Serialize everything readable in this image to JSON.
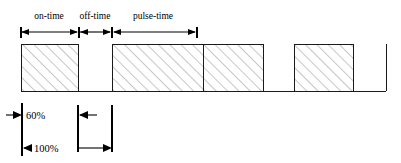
{
  "diagram": {
    "canvas": {
      "width": 401,
      "height": 163
    },
    "colors": {
      "line": "#1a1a1a",
      "hatch": "#8a8a8a",
      "background": "#ffffff",
      "text": "#000000"
    },
    "top_dimensions": [
      {
        "id": "on-time",
        "label": "on-time",
        "x_start": 21,
        "x_end": 78,
        "label_x": 49,
        "label_y": 19
      },
      {
        "id": "off-time",
        "label": "off-time",
        "x_start": 78,
        "x_end": 112,
        "label_x": 95,
        "label_y": 19
      },
      {
        "id": "pulse-time",
        "label": "pulse-time",
        "x_start": 112,
        "x_end": 196,
        "label_x": 153,
        "label_y": 19
      }
    ],
    "dimension_line_y": 32,
    "waveform": {
      "baseline_y": 91,
      "top_y": 44,
      "x_start": 21,
      "x_end": 386,
      "pulses": [
        {
          "index": 1,
          "x_start": 21,
          "x_end": 78
        },
        {
          "index": 2,
          "x_start": 112,
          "x_end": 203
        },
        {
          "index": 3,
          "x_start": 203,
          "x_end": 263
        },
        {
          "index": 4,
          "x_start": 294,
          "x_end": 353
        }
      ],
      "gaps": [
        {
          "x_start": 78,
          "x_end": 112
        },
        {
          "x_start": 263,
          "x_end": 294
        },
        {
          "x_start": 353,
          "x_end": 386
        }
      ]
    },
    "bottom_annotations": {
      "extension_lines": [
        {
          "id": "left-edge",
          "x": 22,
          "y_top": 103,
          "y_bottom": 156
        },
        {
          "id": "on-time-edge",
          "x": 78,
          "y_top": 105,
          "y_bottom": 152
        },
        {
          "id": "pulse-edge",
          "x": 112,
          "y_top": 105,
          "y_bottom": 152
        }
      ],
      "measures": [
        {
          "id": "duty-60",
          "label": "60%",
          "label_x": 26,
          "label_y": 118,
          "arrow_y": 115,
          "arrow_from_x": 22,
          "arrow_to_x": 8,
          "direction": "left"
        },
        {
          "id": "duty-100",
          "label": "100%",
          "label_x": 28,
          "label_y": 152,
          "arrow_y": 148,
          "arrow_from_x": 22,
          "arrow_to_x": 8,
          "direction": "left"
        },
        {
          "id": "off-span-upper",
          "label": "",
          "arrow_y": 115,
          "arrow_from_x": 78,
          "arrow_to_x": 95,
          "direction": "left-inner"
        },
        {
          "id": "off-span-lower",
          "label": "",
          "arrow_y": 148,
          "arrow_from_x": 78,
          "arrow_to_x": 112,
          "direction": "right-inner"
        }
      ]
    }
  }
}
